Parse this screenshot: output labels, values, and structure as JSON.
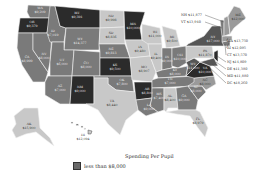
{
  "title": "Spending Per Pupil",
  "legend": [
    {
      "label": "less than $8,000",
      "color": "#6a6a6a"
    }
  ],
  "colors": {
    "c1": "#2b2b2b",
    "c2": "#555555",
    "c3": "#7a7a7a",
    "c4": "#9a9a9a",
    "c5": "#c8c8c8"
  },
  "states": [
    {
      "abbr": "WA",
      "value": "$9,209",
      "x": 40,
      "y": 11,
      "shade": "c3"
    },
    {
      "abbr": "OR",
      "value": "$9,379",
      "x": 32,
      "y": 25,
      "shade": "c1"
    },
    {
      "abbr": "CA",
      "value": "$8,999",
      "x": 27,
      "y": 60,
      "shade": "c3"
    },
    {
      "abbr": "ID",
      "value": "$7,019",
      "x": 53,
      "y": 34,
      "shade": "c3"
    },
    {
      "abbr": "NV",
      "value": "$8,000",
      "x": 44,
      "y": 57,
      "shade": "c3"
    },
    {
      "abbr": "MT",
      "value": "$9,391",
      "x": 77,
      "y": 16,
      "shade": "c1"
    },
    {
      "abbr": "WY",
      "value": "$14,377",
      "x": 80,
      "y": 42,
      "shade": "c3"
    },
    {
      "abbr": "UT",
      "value": "$6,000",
      "x": 62,
      "y": 63,
      "shade": "c3"
    },
    {
      "abbr": "CO",
      "value": "$8,000",
      "x": 86,
      "y": 66,
      "shade": "c3"
    },
    {
      "abbr": "AZ",
      "value": "$7,000",
      "x": 60,
      "y": 89,
      "shade": "c3"
    },
    {
      "abbr": "NM",
      "value": "$9,000",
      "x": 80,
      "y": 90,
      "shade": "c1"
    },
    {
      "abbr": "ND",
      "value": "$9,998",
      "x": 111,
      "y": 19,
      "shade": "c5"
    },
    {
      "abbr": "SD",
      "value": "$8,836",
      "x": 111,
      "y": 36,
      "shade": "c5"
    },
    {
      "abbr": "NE",
      "value": "$9,813",
      "x": 111,
      "y": 52,
      "shade": "c3"
    },
    {
      "abbr": "KS",
      "value": "$9,500",
      "x": 115,
      "y": 68,
      "shade": "c1"
    },
    {
      "abbr": "OK",
      "value": "$7,800",
      "x": 122,
      "y": 83,
      "shade": "c3"
    },
    {
      "abbr": "TX",
      "value": "$8,440",
      "x": 112,
      "y": 104,
      "shade": "c5"
    },
    {
      "abbr": "MN",
      "value": "$10,000",
      "x": 133,
      "y": 27,
      "shade": "c1"
    },
    {
      "abbr": "IA",
      "value": "$9,480",
      "x": 140,
      "y": 50,
      "shade": "c5"
    },
    {
      "abbr": "MO",
      "value": "$8,907",
      "x": 144,
      "y": 70,
      "shade": "c5"
    },
    {
      "abbr": "AR",
      "value": "$8,800",
      "x": 147,
      "y": 92,
      "shade": "c1"
    },
    {
      "abbr": "LA",
      "value": "$9,000",
      "x": 149,
      "y": 108,
      "shade": "c3"
    },
    {
      "abbr": "WI",
      "value": "$11,000",
      "x": 155,
      "y": 35,
      "shade": "c5"
    },
    {
      "abbr": "IL",
      "value": "$9,400",
      "x": 156,
      "y": 57,
      "shade": "c5"
    },
    {
      "abbr": "MI",
      "value": "$9,600",
      "x": 172,
      "y": 40,
      "shade": "c5"
    },
    {
      "abbr": "IN",
      "value": "$9,000",
      "x": 167,
      "y": 60,
      "shade": "c3"
    },
    {
      "abbr": "OH",
      "value": "$10,000",
      "x": 180,
      "y": 58,
      "shade": "c3"
    },
    {
      "abbr": "KY",
      "value": "$8,000",
      "x": 175,
      "y": 73,
      "shade": "c3"
    },
    {
      "abbr": "TN",
      "value": "$7,000",
      "x": 170,
      "y": 82,
      "shade": "c3"
    },
    {
      "abbr": "MS",
      "value": "$7,400",
      "x": 159,
      "y": 97,
      "shade": "c3"
    },
    {
      "abbr": "AL",
      "value": "$8,400",
      "x": 170,
      "y": 99,
      "shade": "c5"
    },
    {
      "abbr": "GA",
      "value": "$9,000",
      "x": 184,
      "y": 99,
      "shade": "c3"
    },
    {
      "abbr": "FL",
      "value": "$8,979",
      "x": 198,
      "y": 122,
      "shade": "c5"
    },
    {
      "abbr": "SC",
      "value": "$8,000",
      "x": 196,
      "y": 90,
      "shade": "c3"
    },
    {
      "abbr": "NC",
      "value": "$8,000",
      "x": 205,
      "y": 83,
      "shade": "c4"
    },
    {
      "abbr": "VA",
      "value": "$10,000",
      "x": 205,
      "y": 71,
      "shade": "c1"
    },
    {
      "abbr": "WV",
      "value": "$11,000",
      "x": 193,
      "y": 67,
      "shade": "c2"
    },
    {
      "abbr": "PA",
      "value": "$11,870",
      "x": 205,
      "y": 54,
      "shade": "c5"
    },
    {
      "abbr": "NY",
      "value": "$17,000",
      "x": 213,
      "y": 40,
      "shade": "c2"
    },
    {
      "abbr": "ME",
      "value": "$12,000",
      "x": 238,
      "y": 18,
      "shade": "c4"
    },
    {
      "abbr": "AK",
      "value": "$15,900",
      "x": 29,
      "y": 127,
      "shade": "c5"
    },
    {
      "abbr": "HI",
      "value": "$12,094",
      "x": 83,
      "y": 138,
      "shade": "c5"
    }
  ],
  "callouts_left": [
    {
      "abbr": "NH",
      "value": "$11,877",
      "x": 181,
      "y": 15
    },
    {
      "abbr": "VT",
      "value": "$13,940",
      "x": 181,
      "y": 22
    }
  ],
  "callouts_right": [
    {
      "abbr": "MA",
      "value": "$13,750",
      "x": 227,
      "y": 41
    },
    {
      "abbr": "RI",
      "value": "$12,095",
      "x": 227,
      "y": 48
    },
    {
      "abbr": "CT",
      "value": "$13,570",
      "x": 227,
      "y": 55
    },
    {
      "abbr": "NJ",
      "value": "$14,809",
      "x": 227,
      "y": 62
    },
    {
      "abbr": "DE",
      "value": "$11,380",
      "x": 227,
      "y": 69
    },
    {
      "abbr": "MD",
      "value": "$11,880",
      "x": 227,
      "y": 76
    },
    {
      "abbr": "DC",
      "value": "$18,260",
      "x": 227,
      "y": 83
    }
  ]
}
